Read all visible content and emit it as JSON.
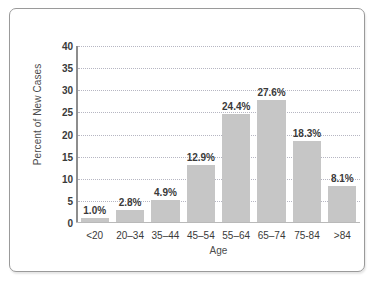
{
  "chart_data": {
    "type": "bar",
    "title": "",
    "subtitle": "",
    "xlabel": "Age",
    "ylabel": "Percent of New Cases",
    "categories": [
      "<20",
      "20–34",
      "35–44",
      "45–54",
      "55–64",
      "65–74",
      "75-84",
      ">84"
    ],
    "values": [
      1.0,
      2.8,
      4.9,
      12.9,
      24.4,
      27.6,
      18.3,
      8.1
    ],
    "data_labels": [
      "1.0%",
      "2.8%",
      "4.9%",
      "12.9%",
      "24.4%",
      "27.6%",
      "18.3%",
      "8.1%"
    ],
    "ylim": [
      0,
      40
    ],
    "ytick_values": [
      0,
      5,
      10,
      15,
      20,
      25,
      30,
      35,
      40
    ],
    "ytick_labels": [
      "0",
      "5",
      "10",
      "15",
      "20",
      "25",
      "30",
      "35",
      "40"
    ],
    "grid": true,
    "grid_orientation": "horizontal",
    "grid_style": "dotted",
    "legend": false,
    "legend_position": "none",
    "bar_color": "#c6c6c6",
    "axis_color": "#8d8d8d",
    "gridline_color": "#b6b6c2",
    "text_color": "#3a3a3a",
    "frame_border_color": "#9a9a9a",
    "background_color": "#ffffff"
  }
}
